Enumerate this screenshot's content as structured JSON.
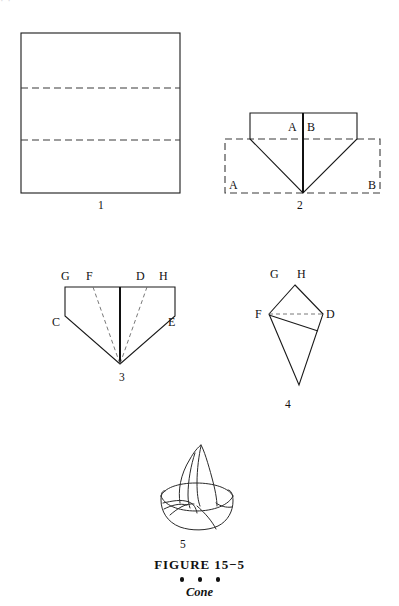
{
  "page": {
    "width": 399,
    "height": 606,
    "background": "#ffffff",
    "ink": "#1a1a1a",
    "top_bleed_text": "· ·"
  },
  "caption": {
    "title": "FIGURE  15−5",
    "dots": "• • •",
    "subtitle": "Cone"
  },
  "steps": [
    {
      "number": "1",
      "name": "square-napkin-with-fold-lines",
      "description": "Open square napkin showing two horizontal dashed fold lines",
      "labels": []
    },
    {
      "number": "2",
      "name": "folded-point-down",
      "description": "Napkin folded to a downward point over dashed original outline",
      "labels": [
        "A",
        "B",
        "A",
        "B"
      ]
    },
    {
      "number": "3",
      "name": "point-down-with-fold-guides",
      "description": "Point-down shape with dashed guide lines from F and D to apex",
      "labels": [
        "G",
        "F",
        "D",
        "H",
        "C",
        "E"
      ]
    },
    {
      "number": "4",
      "name": "kite-shape-rolled",
      "description": "Kite shape with dashed line F to D and solid roll line",
      "labels": [
        "G",
        "H",
        "F",
        "D"
      ]
    },
    {
      "number": "5",
      "name": "finished-cone",
      "description": "Finished cone napkin fold standing in a base",
      "labels": []
    }
  ],
  "fig1": {
    "number": "1",
    "number_x": 98,
    "number_y": 199
  },
  "fig2": {
    "number": "2",
    "number_x": 297,
    "number_y": 199,
    "label_a_top": "A",
    "label_b_top": "B",
    "label_a_bottom": "A",
    "label_b_bottom": "B"
  },
  "fig3": {
    "number": "3",
    "number_x": 119,
    "number_y": 371,
    "label_g": "G",
    "label_f": "F",
    "label_d": "D",
    "label_h": "H",
    "label_c": "C",
    "label_e": "E"
  },
  "fig4": {
    "number": "4",
    "number_x": 285,
    "number_y": 398,
    "label_g": "G",
    "label_h": "H",
    "label_f": "F",
    "label_d": "D"
  },
  "fig5": {
    "number": "5",
    "number_x": 180,
    "number_y": 538
  }
}
